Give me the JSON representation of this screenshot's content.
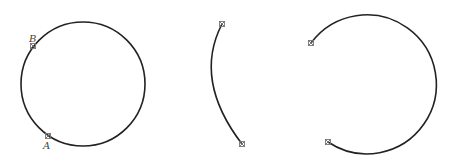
{
  "figures": [
    {
      "id": "full-circle",
      "shape": "circle",
      "center": [
        83,
        84
      ],
      "radius": 62,
      "points": [
        {
          "label": "B",
          "pos": [
            33,
            46
          ]
        },
        {
          "label": "A",
          "pos": [
            48,
            136
          ]
        }
      ]
    },
    {
      "id": "minor-arc",
      "shape": "arc",
      "start": [
        222,
        24
      ],
      "end": [
        242,
        144
      ],
      "leftmost": [
        206,
        78
      ]
    },
    {
      "id": "major-arc",
      "shape": "arc",
      "center": [
        365,
        84.5
      ],
      "radius": 69.5,
      "start": [
        311,
        43
      ],
      "end": [
        328,
        142
      ]
    }
  ],
  "labels": {
    "point_b": "B",
    "point_a": "A"
  },
  "colors": {
    "stroke": "#222222",
    "marker": "#777777",
    "background": "#ffffff"
  }
}
